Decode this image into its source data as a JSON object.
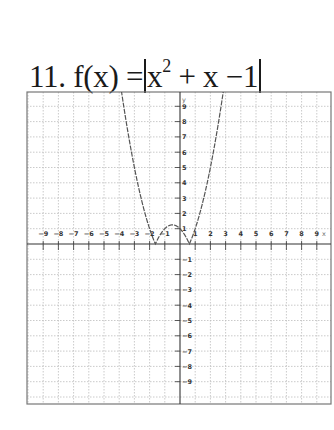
{
  "problem": {
    "number": "11.",
    "lhs": "f(x) =",
    "expr_base": "x",
    "exponent": "2",
    "expr_rest": " + x −1"
  },
  "chart_data": {
    "type": "line",
    "xlabel": "x",
    "ylabel": "y",
    "xlim": [
      -10,
      10
    ],
    "ylim": [
      -10,
      10
    ],
    "grid": true,
    "x_ticks": [
      -9,
      -8,
      -7,
      -6,
      -5,
      -4,
      -3,
      -2,
      -1,
      1,
      2,
      3,
      4,
      5,
      6,
      7,
      8,
      9
    ],
    "y_ticks": [
      9,
      8,
      7,
      6,
      5,
      4,
      3,
      2,
      1,
      -1,
      -2,
      -3,
      -4,
      -5,
      -6,
      -7,
      -8,
      -9
    ],
    "series": [
      {
        "name": "f(x) = |x^2 + x - 1|",
        "x": [
          -4.1,
          -3.5,
          -3,
          -2.5,
          -2,
          -1.618,
          -1.25,
          -1,
          -0.5,
          0,
          0.3,
          0.618,
          1,
          1.5,
          2,
          2.5,
          3.05
        ],
        "values": [
          11.71,
          7.75,
          5,
          2.75,
          1,
          0,
          0.69,
          1,
          1.25,
          1,
          0.61,
          0,
          1,
          2.75,
          5,
          7.75,
          11.35
        ]
      }
    ],
    "zeros": [
      -1.618,
      0.618
    ]
  }
}
